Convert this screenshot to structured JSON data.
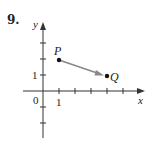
{
  "problem": {
    "number": "9."
  },
  "axes": {
    "x_label": "x",
    "y_label": "y",
    "origin_label": "0",
    "x_tick_label": "1",
    "y_tick_label": "1"
  },
  "points": {
    "P": {
      "label": "P",
      "x": 1,
      "y": 2
    },
    "Q": {
      "label": "Q",
      "x": 4,
      "y": 1
    }
  },
  "colors": {
    "axis": "#333333",
    "vector": "#888888",
    "point": "#111111"
  }
}
